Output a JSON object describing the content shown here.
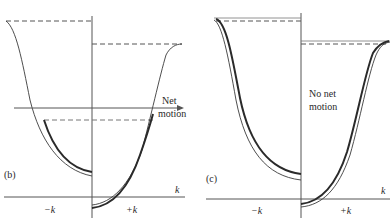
{
  "figure": {
    "panels": [
      {
        "id": "b",
        "label": "(b)",
        "annotation_line1": "Net",
        "annotation_line2": "motion",
        "x_axis_label": "k",
        "neg_label": "−k",
        "pos_label": "+k"
      },
      {
        "id": "c",
        "label": "(c)",
        "annotation_line1": "No net",
        "annotation_line2": "motion",
        "x_axis_label": "k",
        "neg_label": "−k",
        "pos_label": "+k"
      }
    ],
    "colors": {
      "line": "#3a3a3a",
      "axis": "#555555",
      "dashed": "#555555",
      "text": "#2a2a2a"
    }
  }
}
